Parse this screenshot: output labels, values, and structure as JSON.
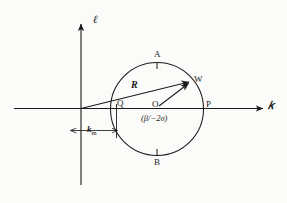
{
  "figure": {
    "background_color": "#fbfbf9",
    "ink_color": "#1b1b1b",
    "axes": {
      "vertical_label": "ℓ",
      "horizontal_label": "𝑘",
      "origin": {
        "x": 81,
        "y": 108
      }
    },
    "circle": {
      "center_label": "O",
      "center_value": "(β/−2σ)",
      "center": {
        "x": 157,
        "y": 109
      },
      "radius": 47
    },
    "points": [
      {
        "name": "A",
        "label": "A",
        "position": "top",
        "x": 157,
        "y": 62
      },
      {
        "name": "B",
        "label": "B",
        "position": "bottom",
        "x": 157,
        "y": 156
      },
      {
        "name": "P",
        "label": "P",
        "position": "right",
        "x": 204,
        "y": 109
      },
      {
        "name": "Q",
        "label": "Q",
        "position": "left",
        "x": 117,
        "y": 109
      },
      {
        "name": "W",
        "label": "W",
        "position": "upper-right-arc",
        "x": 190,
        "y": 82
      },
      {
        "name": "O",
        "label": "O",
        "position": "center",
        "x": 157,
        "y": 109
      }
    ],
    "vectors": [
      {
        "name": "R",
        "label": "R",
        "from": "axes-origin",
        "to": "W"
      },
      {
        "name": "radius-OW",
        "label": "",
        "from": "O",
        "to": "W"
      }
    ],
    "dimension": {
      "label": "k",
      "subscript": "m",
      "arrow_left": "←",
      "arrow_right": "→",
      "from_x": 81,
      "to_x": 117,
      "y": 131
    }
  }
}
